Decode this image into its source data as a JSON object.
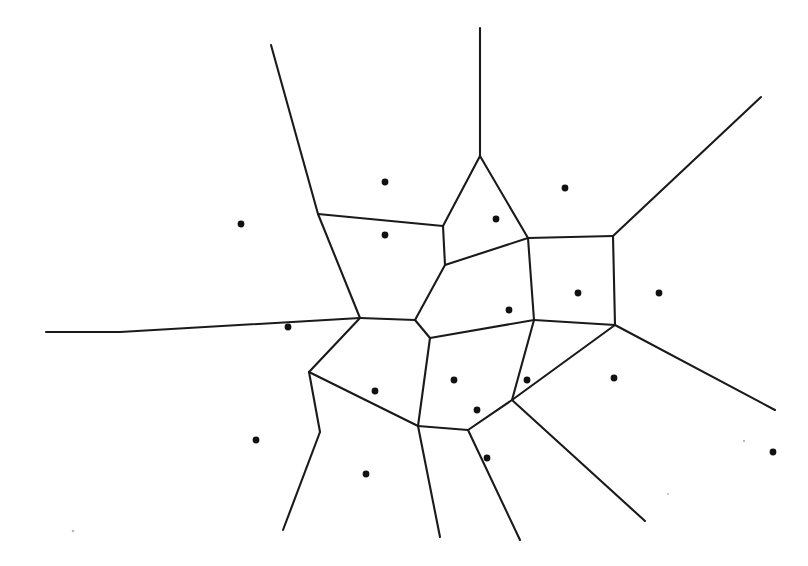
{
  "figure": {
    "kind": "voronoi-diagram",
    "title": "",
    "background_color": "#ffffff",
    "edge_color": "#1a1a1a",
    "seed_color": "#111111",
    "edge_width": 2.1,
    "seed_radius": 3.4,
    "width": 808,
    "height": 566
  },
  "chart_data": {
    "type": "scatter",
    "title": "",
    "subtitle": "",
    "xlabel": "",
    "ylabel": "",
    "grid": false,
    "legend": "none",
    "xlim": [
      0,
      808
    ],
    "ylim": [
      0,
      566
    ],
    "seed_count": 20,
    "vertex_count": 17,
    "edge_count": 28,
    "ray_count": 9,
    "seeds": [
      {
        "id": "s1",
        "x": 385,
        "y": 182
      },
      {
        "id": "s2",
        "x": 241,
        "y": 224
      },
      {
        "id": "s3",
        "x": 385,
        "y": 235
      },
      {
        "id": "s4",
        "x": 496,
        "y": 219
      },
      {
        "id": "s5",
        "x": 565,
        "y": 188
      },
      {
        "id": "s6",
        "x": 288,
        "y": 327
      },
      {
        "id": "s7",
        "x": 509,
        "y": 310
      },
      {
        "id": "s8",
        "x": 578,
        "y": 293
      },
      {
        "id": "s9",
        "x": 659,
        "y": 293
      },
      {
        "id": "s10",
        "x": 375,
        "y": 391
      },
      {
        "id": "s11",
        "x": 454,
        "y": 380
      },
      {
        "id": "s12",
        "x": 527,
        "y": 380
      },
      {
        "id": "s13",
        "x": 614,
        "y": 378
      },
      {
        "id": "s14",
        "x": 477,
        "y": 410
      },
      {
        "id": "s15",
        "x": 256,
        "y": 440
      },
      {
        "id": "s16",
        "x": 366,
        "y": 474
      },
      {
        "id": "s17",
        "x": 487,
        "y": 458
      },
      {
        "id": "s18",
        "x": 773,
        "y": 452
      }
    ],
    "specks": [
      {
        "id": "k1",
        "x": 73,
        "y": 531,
        "r": 1.3
      },
      {
        "id": "k2",
        "x": 744,
        "y": 441,
        "r": 1.2
      },
      {
        "id": "k3",
        "x": 668,
        "y": 494,
        "r": 1.1
      }
    ],
    "vertices": [
      {
        "id": "v1",
        "x": 318,
        "y": 214
      },
      {
        "id": "v2",
        "x": 443,
        "y": 226
      },
      {
        "id": "v3",
        "x": 480,
        "y": 156
      },
      {
        "id": "v4",
        "x": 528,
        "y": 238
      },
      {
        "id": "v5",
        "x": 613,
        "y": 236
      },
      {
        "id": "v6",
        "x": 445,
        "y": 265
      },
      {
        "id": "v7",
        "x": 360,
        "y": 318
      },
      {
        "id": "v8",
        "x": 120,
        "y": 332
      },
      {
        "id": "v9",
        "x": 415,
        "y": 320
      },
      {
        "id": "v10",
        "x": 534,
        "y": 320
      },
      {
        "id": "v11",
        "x": 615,
        "y": 325
      },
      {
        "id": "v12",
        "x": 430,
        "y": 338
      },
      {
        "id": "v13",
        "x": 309,
        "y": 372
      },
      {
        "id": "v14",
        "x": 418,
        "y": 426
      },
      {
        "id": "v15",
        "x": 320,
        "y": 432
      },
      {
        "id": "v16",
        "x": 468,
        "y": 430
      },
      {
        "id": "v17",
        "x": 512,
        "y": 400
      }
    ],
    "edges": [
      {
        "from": "v1",
        "to": "v2",
        "note": "upper horizontal-ish edge"
      },
      {
        "from": "v2",
        "to": "v3",
        "note": "left flank of tall triangle cell"
      },
      {
        "from": "v3",
        "to": "v4",
        "note": "right flank of tall triangle cell"
      },
      {
        "from": "v4",
        "to": "v5",
        "note": "edge to right vertex"
      },
      {
        "from": "v2",
        "to": "v6",
        "note": "short link down"
      },
      {
        "from": "v6",
        "to": "v4",
        "note": "link up-right"
      },
      {
        "from": "v6",
        "to": "v9",
        "note": "link down-left"
      },
      {
        "from": "v1",
        "to": "v7",
        "note": "left side of large cell"
      },
      {
        "from": "v7",
        "to": "v9",
        "note": "short central edge"
      },
      {
        "from": "v7",
        "to": "v8",
        "note": "long edge to left apex"
      },
      {
        "from": "v9",
        "to": "v12",
        "note": "short central edge"
      },
      {
        "from": "v12",
        "to": "v10",
        "note": "edge up-right"
      },
      {
        "from": "v10",
        "to": "v4",
        "note": "edge up-left"
      },
      {
        "from": "v10",
        "to": "v11",
        "note": "edge right"
      },
      {
        "from": "v5",
        "to": "v11",
        "note": "vertical right edge"
      },
      {
        "from": "v7",
        "to": "v13",
        "note": "edge down-left"
      },
      {
        "from": "v12",
        "to": "v14",
        "note": "edge down"
      },
      {
        "from": "v13",
        "to": "v14",
        "note": "lower horizontal edge"
      },
      {
        "from": "v13",
        "to": "v15",
        "note": "edge down-left"
      },
      {
        "from": "v14",
        "to": "v16",
        "note": "short edge down-right"
      },
      {
        "from": "v16",
        "to": "v17",
        "note": "edge up-right"
      },
      {
        "from": "v17",
        "to": "v10",
        "note": "edge up"
      },
      {
        "from": "v17",
        "to": "v11",
        "note": "edge up-right"
      }
    ],
    "rays": [
      {
        "from": "v1",
        "to": {
          "x": 271,
          "y": 45
        },
        "note": "upper-left ray"
      },
      {
        "from": "v3",
        "to": {
          "x": 480,
          "y": 28
        },
        "note": "top vertical ray"
      },
      {
        "from": "v5",
        "to": {
          "x": 761,
          "y": 97
        },
        "note": "upper-right ray"
      },
      {
        "from": "v8",
        "to": {
          "x": 46,
          "y": 332
        },
        "note": "left horizontal ray"
      },
      {
        "from": "v11",
        "to": {
          "x": 775,
          "y": 410
        },
        "note": "lower-right ray"
      },
      {
        "from": "v15",
        "to": {
          "x": 283,
          "y": 530
        },
        "note": "lower-left ray"
      },
      {
        "from": "v14",
        "to": {
          "x": 440,
          "y": 537
        },
        "note": "bottom ray"
      },
      {
        "from": "v16",
        "to": {
          "x": 520,
          "y": 540
        },
        "note": "bottom ray from v16"
      },
      {
        "from": "v17",
        "to": {
          "x": 645,
          "y": 521
        },
        "note": "lower-right ray from v17"
      }
    ]
  }
}
